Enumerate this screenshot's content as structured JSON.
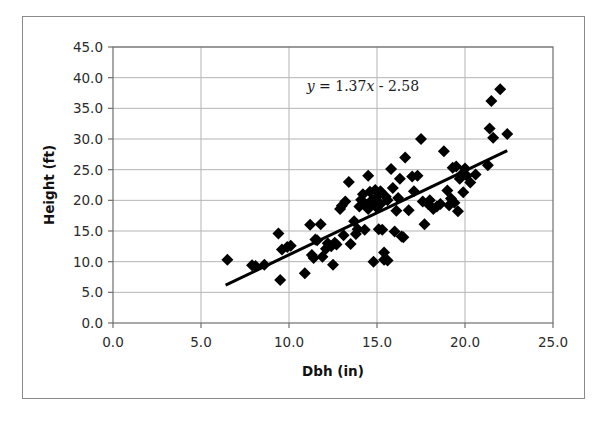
{
  "figure": {
    "kind": "scatter-plot-figure",
    "has_outer_border": true,
    "border_color": "#8a8a8a",
    "background_color": "#ffffff"
  },
  "chart_data": {
    "type": "scatter",
    "title": "",
    "subtitle": "",
    "xlabel": "Dbh (in)",
    "ylabel": "Height (ft)",
    "xlim": [
      0.0,
      25.0
    ],
    "ylim": [
      0.0,
      45.0
    ],
    "xticks": [
      0.0,
      5.0,
      10.0,
      15.0,
      20.0,
      25.0
    ],
    "yticks": [
      0.0,
      5.0,
      10.0,
      15.0,
      20.0,
      25.0,
      30.0,
      35.0,
      40.0,
      45.0
    ],
    "xtick_labels": [
      "0.0",
      "5.0",
      "10.0",
      "15.0",
      "20.0",
      "25.0"
    ],
    "ytick_labels": [
      "0.0",
      "5.0",
      "10.0",
      "15.0",
      "20.0",
      "25.0",
      "30.0",
      "35.0",
      "40.0",
      "45.0"
    ],
    "grid": true,
    "grid_color": "#b5b5b5",
    "legend": false,
    "legend_position": "none",
    "marker": "diamond",
    "marker_color": "#000000",
    "marker_size": 6,
    "annotations": [
      {
        "name": "regression-equation",
        "text": "y = 1.37x - 2.58",
        "text_parts": [
          "y",
          " = 1.37",
          "x",
          " - 2.58"
        ],
        "x": 14.2,
        "y": 37.8
      }
    ],
    "trendline": {
      "name": "linear-fit-line",
      "equation": "y = 1.37x - 2.58",
      "slope": 1.37,
      "intercept": -2.58,
      "color": "#000000",
      "width": 3,
      "x_start": 6.4,
      "x_end": 22.4
    },
    "series": [
      {
        "name": "Tree measurements",
        "points": [
          [
            6.5,
            10.3
          ],
          [
            7.9,
            9.4
          ],
          [
            8.1,
            9.3
          ],
          [
            8.6,
            9.5
          ],
          [
            9.4,
            14.6
          ],
          [
            9.5,
            7.0
          ],
          [
            9.6,
            12.0
          ],
          [
            9.9,
            12.4
          ],
          [
            10.1,
            12.6
          ],
          [
            10.9,
            8.1
          ],
          [
            11.2,
            16.0
          ],
          [
            11.3,
            11.1
          ],
          [
            11.4,
            10.6
          ],
          [
            11.5,
            13.6
          ],
          [
            11.6,
            13.5
          ],
          [
            11.8,
            16.1
          ],
          [
            11.9,
            10.8
          ],
          [
            12.1,
            12.1
          ],
          [
            12.2,
            13.0
          ],
          [
            12.4,
            12.5
          ],
          [
            12.5,
            9.5
          ],
          [
            12.6,
            13.1
          ],
          [
            12.7,
            12.8
          ],
          [
            12.9,
            18.6
          ],
          [
            13.0,
            19.1
          ],
          [
            13.1,
            14.3
          ],
          [
            13.2,
            19.8
          ],
          [
            13.4,
            23.0
          ],
          [
            13.5,
            12.9
          ],
          [
            13.7,
            16.6
          ],
          [
            13.8,
            14.5
          ],
          [
            13.9,
            15.3
          ],
          [
            14.0,
            19.0
          ],
          [
            14.1,
            20.1
          ],
          [
            14.2,
            21.0
          ],
          [
            14.3,
            15.2
          ],
          [
            14.4,
            19.2
          ],
          [
            14.5,
            24.0
          ],
          [
            14.5,
            18.6
          ],
          [
            14.6,
            21.4
          ],
          [
            14.7,
            20.0
          ],
          [
            14.8,
            10.0
          ],
          [
            14.8,
            19.5
          ],
          [
            14.9,
            21.7
          ],
          [
            15.0,
            18.8
          ],
          [
            15.0,
            20.6
          ],
          [
            15.1,
            15.3
          ],
          [
            15.2,
            21.5
          ],
          [
            15.2,
            19.4
          ],
          [
            15.3,
            15.2
          ],
          [
            15.4,
            10.3
          ],
          [
            15.4,
            11.5
          ],
          [
            15.5,
            20.6
          ],
          [
            15.6,
            20.0
          ],
          [
            15.6,
            10.2
          ],
          [
            15.8,
            25.1
          ],
          [
            15.9,
            22.0
          ],
          [
            16.0,
            14.9
          ],
          [
            16.1,
            18.3
          ],
          [
            16.2,
            20.4
          ],
          [
            16.3,
            23.5
          ],
          [
            16.4,
            14.1
          ],
          [
            16.5,
            14.0
          ],
          [
            16.6,
            27.0
          ],
          [
            16.8,
            18.4
          ],
          [
            17.0,
            23.9
          ],
          [
            17.1,
            21.5
          ],
          [
            17.3,
            24.0
          ],
          [
            17.5,
            30.0
          ],
          [
            17.6,
            19.8
          ],
          [
            17.7,
            16.1
          ],
          [
            17.9,
            19.4
          ],
          [
            18.0,
            20.0
          ],
          [
            18.2,
            18.6
          ],
          [
            18.4,
            19.0
          ],
          [
            18.6,
            19.4
          ],
          [
            18.8,
            28.0
          ],
          [
            19.0,
            21.6
          ],
          [
            19.1,
            19.2
          ],
          [
            19.2,
            20.3
          ],
          [
            19.3,
            25.3
          ],
          [
            19.4,
            19.6
          ],
          [
            19.5,
            25.5
          ],
          [
            19.6,
            18.2
          ],
          [
            19.7,
            23.5
          ],
          [
            19.8,
            24.2
          ],
          [
            19.9,
            21.3
          ],
          [
            20.0,
            25.2
          ],
          [
            20.1,
            24.0
          ],
          [
            20.3,
            22.9
          ],
          [
            20.6,
            24.2
          ],
          [
            21.3,
            25.7
          ],
          [
            21.4,
            31.7
          ],
          [
            21.5,
            36.2
          ],
          [
            21.6,
            30.2
          ],
          [
            22.0,
            38.1
          ],
          [
            22.4,
            30.8
          ]
        ]
      }
    ]
  }
}
